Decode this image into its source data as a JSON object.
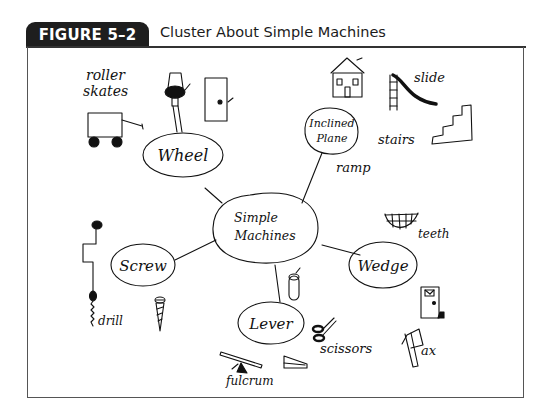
{
  "figure": {
    "label": "FIGURE 5–2",
    "title": "Cluster About Simple Machines"
  },
  "center_node": {
    "line1": "Simple",
    "line2": "Machines"
  },
  "nodes": [
    {
      "id": "wheel",
      "label": "Wheel",
      "examples": [
        "roller skates",
        "wagon",
        "doorknob",
        "door"
      ]
    },
    {
      "id": "inclined-plane",
      "label_line1": "Inclined",
      "label_line2": "Plane",
      "examples": [
        "house",
        "slide",
        "stairs",
        "ramp"
      ]
    },
    {
      "id": "wedge",
      "label": "Wedge",
      "examples": [
        "teeth",
        "door stop",
        "ax"
      ]
    },
    {
      "id": "lever",
      "label": "Lever",
      "examples": [
        "can opener",
        "scissors",
        "seesaw",
        "fulcrum",
        "stapler"
      ]
    },
    {
      "id": "screw",
      "label": "Screw",
      "examples": [
        "drill",
        "screw"
      ]
    }
  ],
  "annotations": {
    "roller1": "roller",
    "roller2": "skates",
    "slide": "slide",
    "stairs": "stairs",
    "ramp": "ramp",
    "teeth": "teeth",
    "ax": "ax",
    "scissors": "scissors",
    "fulcrum": "fulcrum",
    "drill": "drill",
    "can": "CAN"
  },
  "colors": {
    "label_bg": "#1e1e1e",
    "ink": "#111111",
    "frame": "#555555"
  }
}
